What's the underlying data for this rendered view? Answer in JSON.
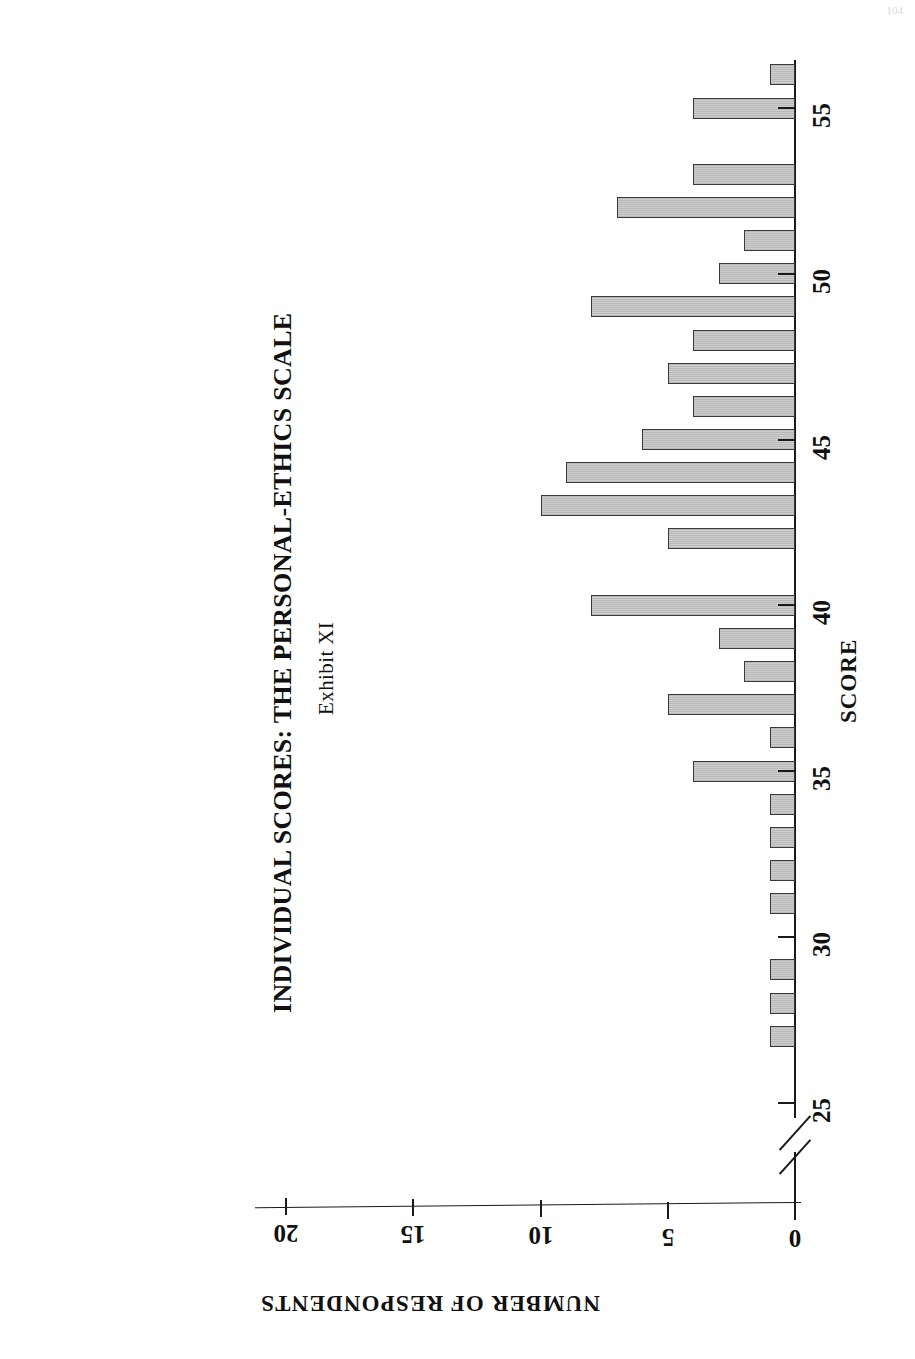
{
  "folio": "104",
  "exhibit_label": "Exhibit XI",
  "chart_title": "INDIVIDUAL SCORES:  THE PERSONAL-ETHICS SCALE",
  "axes": {
    "score_title": "SCORE",
    "respondents_title": "NUMBER OF RESPONDENTS",
    "score_ticks": [
      "25",
      "30",
      "35",
      "40",
      "45",
      "50",
      "55"
    ],
    "respondent_ticks": [
      "0",
      "5",
      "10",
      "15",
      "20"
    ]
  },
  "chart_data": {
    "type": "bar",
    "orientation": "horizontal",
    "title": "INDIVIDUAL SCORES:  THE PERSONAL-ETHICS SCALE",
    "subtitle": "Exhibit XI",
    "xlabel": "SCORE",
    "ylabel": "NUMBER OF RESPONDENTS",
    "xlim": [
      25,
      56
    ],
    "ylim": [
      0,
      20
    ],
    "x_axis_break_below": 25,
    "grid": false,
    "legend": null,
    "categories": [
      27,
      28,
      29,
      30,
      31,
      32,
      33,
      34,
      35,
      36,
      37,
      38,
      39,
      40,
      41,
      42,
      43,
      44,
      45,
      46,
      47,
      48,
      49,
      50,
      51,
      52,
      53,
      54,
      55,
      56
    ],
    "values": [
      1,
      1,
      1,
      0,
      1,
      1,
      1,
      1,
      4,
      1,
      5,
      2,
      3,
      8,
      0,
      5,
      10,
      9,
      6,
      4,
      5,
      4,
      8,
      3,
      2,
      7,
      4,
      0,
      4,
      1
    ],
    "series": [
      {
        "name": "NUMBER OF RESPONDENTS",
        "values": [
          1,
          1,
          1,
          0,
          1,
          1,
          1,
          1,
          4,
          1,
          5,
          2,
          3,
          8,
          0,
          5,
          10,
          9,
          6,
          4,
          5,
          4,
          8,
          3,
          2,
          7,
          4,
          0,
          4,
          1
        ]
      }
    ]
  }
}
